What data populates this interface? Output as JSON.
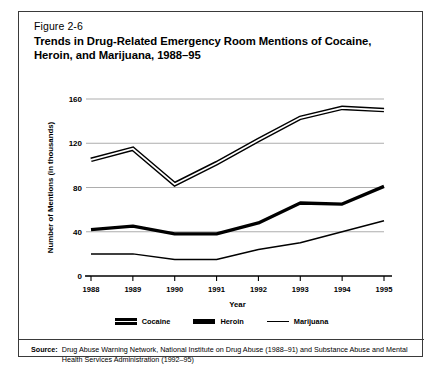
{
  "figure": {
    "number": "Figure 2-6",
    "title": "Trends in Drug-Related Emergency Room Mentions of Cocaine, Heroin, and Marijuana, 1988–95"
  },
  "source": {
    "label": "Source:",
    "text": "Drug Abuse Warning Network, National Institute on Drug Abuse (1988–91) and Substance Abuse and Mental Health Services Administration (1992–95)"
  },
  "legend": {
    "items": [
      {
        "label": "Cocaine",
        "style": "double-line",
        "color": "#000000"
      },
      {
        "label": "Heroin",
        "style": "thick-line",
        "color": "#000000"
      },
      {
        "label": "Marijuana",
        "style": "thin-line",
        "color": "#000000"
      }
    ]
  },
  "chart_data": {
    "type": "line",
    "title": "Trends in Drug-Related Emergency Room Mentions of Cocaine, Heroin, and Marijuana, 1988–95",
    "xlabel": "Year",
    "ylabel": "Number of Mentions (in thousands)",
    "categories": [
      "1988",
      "1989",
      "1990",
      "1991",
      "1992",
      "1993",
      "1994",
      "1995"
    ],
    "x": [
      1988,
      1989,
      1990,
      1991,
      1992,
      1993,
      1994,
      1995
    ],
    "xlim": [
      1988,
      1995
    ],
    "ylim": [
      0,
      160
    ],
    "yticks": [
      0,
      40,
      80,
      120,
      160
    ],
    "xticks": [
      "1988",
      "1989",
      "1990",
      "1991",
      "1992",
      "1993",
      "1994",
      "1995"
    ],
    "grid": "horizontal",
    "legend_position": "bottom-center",
    "series": [
      {
        "name": "Cocaine",
        "values": [
          105,
          115,
          83,
          102,
          123,
          143,
          152,
          150
        ]
      },
      {
        "name": "Heroin",
        "values": [
          42,
          45,
          38,
          38,
          48,
          66,
          65,
          81
        ]
      },
      {
        "name": "Marijuana",
        "values": [
          20,
          20,
          15,
          15,
          24,
          30,
          40,
          50
        ]
      }
    ]
  }
}
